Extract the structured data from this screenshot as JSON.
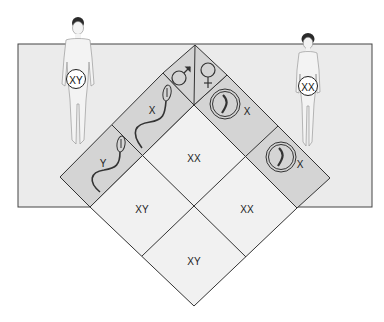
{
  "diagram": {
    "colors": {
      "page_bg": "#ffffff",
      "panel_bg": "#ebebeb",
      "header_band": "#d4d4d4",
      "grid_cell": "#f1f1f1",
      "line": "#333333"
    },
    "parents": {
      "male": {
        "label": "XY",
        "symbol": "♂"
      },
      "female": {
        "label": "XX",
        "symbol": "♀"
      }
    },
    "gametes": {
      "male": [
        {
          "label": "X",
          "icon": "sperm-icon"
        },
        {
          "label": "Y",
          "icon": "sperm-icon"
        }
      ],
      "female": [
        {
          "label": "X",
          "icon": "egg-icon"
        },
        {
          "label": "X",
          "icon": "egg-icon"
        }
      ]
    },
    "offspring": [
      {
        "position": "top",
        "label": "XX"
      },
      {
        "position": "left",
        "label": "XY"
      },
      {
        "position": "right",
        "label": "XX"
      },
      {
        "position": "bottom",
        "label": "XY"
      }
    ]
  }
}
